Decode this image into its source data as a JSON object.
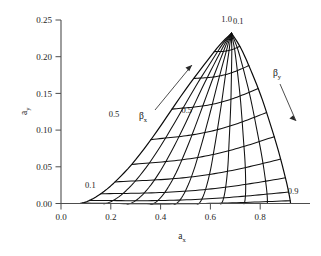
{
  "chart_data": {
    "type": "line",
    "title": "",
    "xlabel": "a_x",
    "ylabel": "a_y",
    "xlim": [
      0.0,
      1.0
    ],
    "ylim": [
      0.0,
      0.26
    ],
    "grid": false,
    "legend": "none",
    "x_ticks": [
      "0.0",
      "0.2",
      "0.4",
      "0.6",
      "0.8"
    ],
    "x_tick_values": [
      0.0,
      0.2,
      0.4,
      0.6,
      0.8
    ],
    "y_ticks": [
      "0.00",
      "0.05",
      "0.10",
      "0.15",
      "0.20",
      "0.25"
    ],
    "y_tick_values": [
      0.0,
      0.05,
      0.1,
      0.15,
      0.2,
      0.25
    ],
    "annotations": [
      {
        "text": "1.0",
        "x": 0.665,
        "y": 0.247,
        "note": "beta_x = 1.0 family endpoint at apex"
      },
      {
        "text": "0.1",
        "x": 0.712,
        "y": 0.245,
        "note": "beta_y = 0.1 family start at apex"
      },
      {
        "text": "0.5",
        "x": 0.505,
        "y": 0.123,
        "note": "beta_y = 0.5 curve label right side"
      },
      {
        "text": "0.5",
        "x": 0.213,
        "y": 0.118,
        "note": "beta_x = 0.5 curve label left side"
      },
      {
        "text": "0.1",
        "x": 0.118,
        "y": 0.0215,
        "note": "beta_x = 0.1 curve label lower left"
      },
      {
        "text": "0.9",
        "x": 0.932,
        "y": 0.0125,
        "note": "beta_y = 0.9 curve end lower right"
      }
    ],
    "family_labels": [
      {
        "text": "β",
        "sub": "x",
        "x": 0.215,
        "y": 0.091,
        "arrow_from": [
          0.255,
          0.103
        ],
        "arrow_to": [
          0.375,
          0.176
        ],
        "direction": "up-right"
      },
      {
        "text": "β",
        "sub": "y",
        "x": 0.755,
        "y": 0.197,
        "arrow_from": [
          0.772,
          0.186
        ],
        "arrow_to": [
          0.845,
          0.122
        ],
        "direction": "down-right"
      }
    ],
    "families": [
      {
        "name": "beta_x",
        "label": "βx",
        "range": [
          0.1,
          1.0
        ],
        "count": 10,
        "values": [
          0.1,
          0.2,
          0.3,
          0.4,
          0.5,
          0.6,
          0.7,
          0.8,
          0.9,
          1.0
        ],
        "note": "Lines of constant beta_x fan upward-right from the origin region toward the apex"
      },
      {
        "name": "beta_y",
        "label": "βy",
        "range": [
          0.1,
          0.9
        ],
        "count": 9,
        "values": [
          0.1,
          0.2,
          0.3,
          0.4,
          0.5,
          0.6,
          0.7,
          0.8,
          0.9
        ],
        "note": "Lines of constant beta_y sweep downward-right from the apex to the a_x axis"
      }
    ],
    "apex": {
      "x": 0.685,
      "y": 0.232
    },
    "left_boundary": {
      "label": "beta_x = 0.1 envelope",
      "points": [
        [
          0.075,
          0.0
        ],
        [
          0.11,
          0.002
        ],
        [
          0.15,
          0.006
        ],
        [
          0.19,
          0.013
        ],
        [
          0.23,
          0.023
        ],
        [
          0.27,
          0.036
        ],
        [
          0.31,
          0.052
        ],
        [
          0.35,
          0.07
        ],
        [
          0.395,
          0.093
        ],
        [
          0.44,
          0.118
        ],
        [
          0.49,
          0.146
        ],
        [
          0.54,
          0.172
        ],
        [
          0.59,
          0.195
        ],
        [
          0.64,
          0.217
        ],
        [
          0.685,
          0.232
        ]
      ]
    },
    "right_boundary": {
      "label": "beta_y = 0.9 envelope",
      "points": [
        [
          0.685,
          0.232
        ],
        [
          0.72,
          0.214
        ],
        [
          0.755,
          0.19
        ],
        [
          0.79,
          0.163
        ],
        [
          0.82,
          0.135
        ],
        [
          0.85,
          0.105
        ],
        [
          0.875,
          0.076
        ],
        [
          0.897,
          0.048
        ],
        [
          0.913,
          0.022
        ],
        [
          0.922,
          0.0
        ]
      ]
    },
    "baseline": {
      "label": "a_y = 0 axis contact",
      "points": [
        [
          0.075,
          0.0
        ],
        [
          0.922,
          0.0
        ]
      ]
    }
  },
  "figure": {
    "background": "#ffffff",
    "line_color": "#111111",
    "axis_color": "#4d4d4d",
    "text_color": "#1a1a1a"
  },
  "axes": {
    "x_axis_title_base": "a",
    "x_axis_title_sub": "x",
    "y_axis_title_base": "a",
    "y_axis_title_sub": "y"
  },
  "labels": {
    "beta_glyph": "β",
    "beta_x_sub": "x",
    "beta_y_sub": "y",
    "apex_left": "1.0",
    "apex_right": "0.1",
    "right_mid": "0.5",
    "left_mid": "0.5",
    "left_low": "0.1",
    "right_low": "0.9"
  }
}
